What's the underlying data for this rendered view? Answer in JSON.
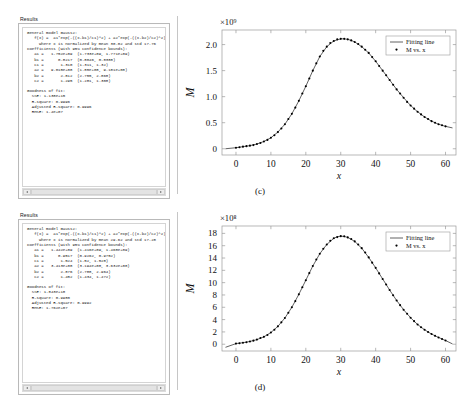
{
  "panels": [
    {
      "label": "Results",
      "lines": [
        "General model Gauss2:",
        "   f(x) =  a1*exp(-((x-b1)/c1)^2) + a2*exp(-((x-b2)/c2)^2)",
        "     where x is normalized by mean 30.02 and std 17.76",
        "Coefficients (with 95% confidence bounds):",
        "   a1 =   1.752e+09  (1.733e+09, 1.771e+09)",
        "   b1 =      0.8217  (0.8046, 0.8388)",
        "   c1 =       1.310  (1.311, 1.32)",
        "   a2 =   9.015e+08  (1.85e+08, 9.181e+08)",
        "   b2 =       2.812  (2.755, 2.868)",
        "   c2 =       1.295  (1.281, 1.308)",
        "",
        "Goodness of fit:",
        "  SSE: 1.138e+15",
        "  R-square: 0.9996",
        "  Adjusted R-square: 0.9996",
        "  RMSE: 1.4e+07"
      ]
    },
    {
      "label": "Results",
      "lines": [
        "General model Gauss2:",
        "   f(x) =  a1*exp(-((x-b1)/c1)^2) + a2*exp(-((x-b2)/c2)^2)",
        "     where x is normalized by mean 29.62 and std 17.28",
        "Coefficients (with 95% confidence bounds):",
        "   a1 =   1.442e+09  (1.416e+09, 1.468e+09)",
        "   b1 =      0.9517  (0.9262, 0.9752)",
        "   c1 =       1.524  (1.52, 1.528)",
        "   a2 =   3.413e+08  (3.194e+08, 3.632e+08)",
        "   b2 =       2.876  (2.788, 2.964)",
        "   c2 =       1.452  (1.434, 1.472)",
        "",
        "Goodness of fit:",
        "  SSE: 1.843e+18",
        "  R-square: 0.9980",
        "  Adjusted R-square: 0.9992",
        "  RMSE: 1.762e+07"
      ]
    }
  ],
  "chart_data": [
    {
      "type": "line",
      "title": "",
      "caption": "(c)",
      "xlabel": "x",
      "ylabel": "M",
      "y_multiplier": "×10⁹",
      "y_multiplier_base": 1000000000,
      "xlim": [
        -4,
        63
      ],
      "ylim": [
        -0.12,
        2.28
      ],
      "xticks": [
        0,
        10,
        20,
        30,
        40,
        50,
        60
      ],
      "yticks": [
        0,
        0.5,
        1.0,
        1.5,
        2.0
      ],
      "ytick_labels": [
        "0",
        "0.5",
        "1.0",
        "1.5",
        "2.0"
      ],
      "grid": false,
      "legend_position": "upper right",
      "series": [
        {
          "name": "Fitting line",
          "style": "line",
          "x": [
            -3,
            0,
            2,
            4,
            6,
            8,
            10,
            12,
            14,
            16,
            18,
            20,
            22,
            24,
            26,
            28,
            30,
            31,
            32,
            33,
            34,
            36,
            38,
            40,
            42,
            44,
            46,
            48,
            50,
            52,
            54,
            56,
            58,
            60,
            62
          ],
          "y": [
            0.0,
            0.02,
            0.04,
            0.06,
            0.09,
            0.14,
            0.21,
            0.32,
            0.47,
            0.67,
            0.92,
            1.2,
            1.5,
            1.77,
            1.96,
            2.07,
            2.11,
            2.11,
            2.1,
            2.08,
            2.05,
            1.96,
            1.84,
            1.68,
            1.5,
            1.32,
            1.14,
            0.98,
            0.83,
            0.71,
            0.61,
            0.53,
            0.47,
            0.43,
            0.4
          ]
        },
        {
          "name": "M vs. x",
          "style": "dots",
          "x": [
            0,
            1,
            2,
            3,
            4,
            5,
            6,
            7,
            8,
            9,
            10,
            11,
            12,
            13,
            14,
            15,
            16,
            17,
            18,
            19,
            20,
            21,
            22,
            23,
            24,
            25,
            26,
            27,
            28,
            29,
            30,
            31,
            32,
            33,
            34,
            35,
            36,
            37,
            38,
            39,
            40,
            41,
            42,
            43,
            44,
            45,
            46,
            47,
            48,
            49,
            50,
            51,
            52,
            53,
            54,
            55,
            56,
            57,
            58,
            59,
            60
          ],
          "y": [
            0.02,
            0.03,
            0.04,
            0.05,
            0.06,
            0.07,
            0.09,
            0.11,
            0.14,
            0.17,
            0.21,
            0.26,
            0.32,
            0.39,
            0.47,
            0.57,
            0.67,
            0.79,
            0.92,
            1.06,
            1.2,
            1.35,
            1.5,
            1.64,
            1.77,
            1.88,
            1.96,
            2.03,
            2.07,
            2.1,
            2.11,
            2.11,
            2.1,
            2.08,
            2.05,
            2.01,
            1.96,
            1.9,
            1.84,
            1.76,
            1.68,
            1.59,
            1.5,
            1.41,
            1.32,
            1.23,
            1.14,
            1.06,
            0.98,
            0.9,
            0.83,
            0.77,
            0.71,
            0.66,
            0.61,
            0.57,
            0.53,
            0.5,
            0.47,
            0.45,
            0.43
          ]
        }
      ]
    },
    {
      "type": "line",
      "title": "",
      "caption": "(d)",
      "xlabel": "x",
      "ylabel": "M",
      "y_multiplier": "×10⁸",
      "y_multiplier_base": 100000000,
      "xlim": [
        -4,
        63
      ],
      "ylim": [
        -1.1,
        19.2
      ],
      "xticks": [
        0,
        10,
        20,
        30,
        40,
        50,
        60
      ],
      "yticks": [
        0,
        2,
        4,
        6,
        8,
        10,
        12,
        14,
        16,
        18
      ],
      "ytick_labels": [
        "0",
        "2",
        "4",
        "6",
        "8",
        "10",
        "12",
        "14",
        "16",
        "18"
      ],
      "grid": false,
      "legend_position": "upper right",
      "series": [
        {
          "name": "Fitting line",
          "style": "line",
          "x": [
            -3,
            0,
            2,
            4,
            6,
            8,
            10,
            12,
            14,
            16,
            18,
            20,
            22,
            24,
            26,
            28,
            29,
            30,
            31,
            32,
            34,
            36,
            38,
            40,
            42,
            44,
            46,
            48,
            50,
            52,
            54,
            56,
            58,
            60,
            62
          ],
          "y": [
            -0.5,
            0.1,
            0.25,
            0.45,
            0.75,
            1.2,
            1.9,
            2.9,
            4.25,
            6.0,
            8.1,
            10.4,
            12.7,
            14.7,
            16.2,
            17.2,
            17.45,
            17.55,
            17.5,
            17.35,
            16.7,
            15.6,
            14.1,
            12.4,
            10.6,
            8.8,
            7.1,
            5.6,
            4.3,
            3.2,
            2.35,
            1.65,
            1.1,
            0.6,
            0.05
          ]
        },
        {
          "name": "M vs. x",
          "style": "dots",
          "x": [
            0,
            1,
            2,
            3,
            4,
            5,
            6,
            7,
            8,
            9,
            10,
            11,
            12,
            13,
            14,
            15,
            16,
            17,
            18,
            19,
            20,
            21,
            22,
            23,
            24,
            25,
            26,
            27,
            28,
            29,
            30,
            31,
            32,
            33,
            34,
            35,
            36,
            37,
            38,
            39,
            40,
            41,
            42,
            43,
            44,
            45,
            46,
            47,
            48,
            49,
            50,
            51,
            52,
            53,
            54,
            55,
            56,
            57,
            58,
            59,
            60
          ],
          "y": [
            0.1,
            0.16,
            0.25,
            0.33,
            0.45,
            0.58,
            0.75,
            1.0,
            1.2,
            1.5,
            1.9,
            2.35,
            2.9,
            3.55,
            4.25,
            5.1,
            6.0,
            7.0,
            8.1,
            9.25,
            10.4,
            11.55,
            12.7,
            13.75,
            14.7,
            15.5,
            16.2,
            16.8,
            17.2,
            17.4,
            17.55,
            17.52,
            17.35,
            17.1,
            16.7,
            16.2,
            15.6,
            14.9,
            14.1,
            13.25,
            12.4,
            11.5,
            10.6,
            9.7,
            8.8,
            7.95,
            7.1,
            6.35,
            5.6,
            4.95,
            4.3,
            3.75,
            3.2,
            2.75,
            2.35,
            1.98,
            1.65,
            1.36,
            1.1,
            0.84,
            0.6
          ]
        }
      ]
    }
  ]
}
